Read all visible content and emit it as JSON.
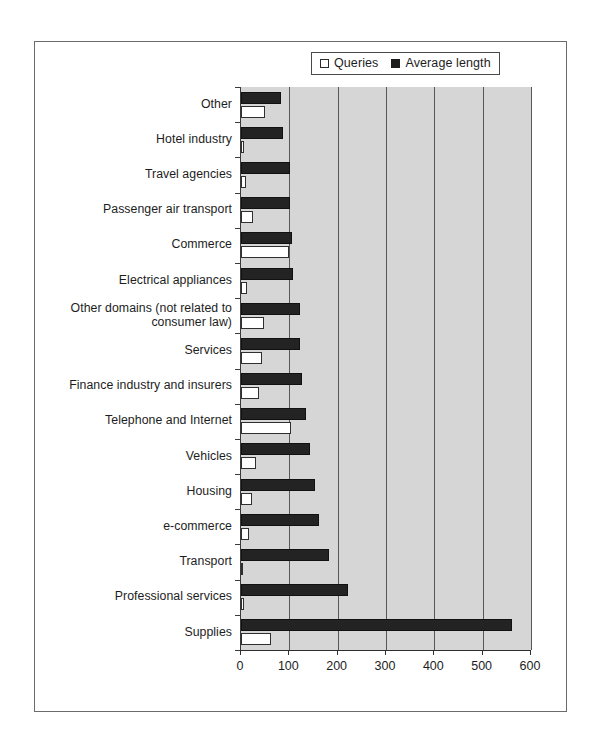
{
  "legend": {
    "entries": [
      {
        "label": "Queries",
        "icon": "hollow-square",
        "color": "#ffffff"
      },
      {
        "label": "Average length",
        "icon": "filled-square",
        "color": "#232323"
      }
    ]
  },
  "axis": {
    "x_ticks": [
      "0",
      "100",
      "200",
      "300",
      "400",
      "500",
      "600"
    ]
  },
  "chart_data": {
    "type": "bar",
    "orientation": "horizontal",
    "title": "",
    "xlabel": "",
    "ylabel": "",
    "xlim": [
      0,
      600
    ],
    "xticks": [
      0,
      100,
      200,
      300,
      400,
      500,
      600
    ],
    "grid": true,
    "legend_position": "top-right",
    "plot_background": "#d6d6d6",
    "categories": [
      "Other",
      "Hotel industry",
      "Travel agencies",
      "Passenger air transport",
      "Commerce",
      "Electrical appliances",
      "Other domains (not related to\nconsumer law)",
      "Services",
      "Finance industry and insurers",
      "Telephone and Internet",
      "Vehicles",
      "Housing",
      "e-commerce",
      "Transport",
      "Professional services",
      "Supplies"
    ],
    "series": [
      {
        "name": "Average length",
        "color": "#232323",
        "values": [
          83,
          87,
          102,
          102,
          105,
          108,
          122,
          122,
          127,
          135,
          142,
          154,
          162,
          182,
          222,
          560
        ]
      },
      {
        "name": "Queries",
        "color": "#ffffff",
        "values": [
          50,
          7,
          10,
          25,
          100,
          13,
          48,
          44,
          38,
          104,
          31,
          23,
          17,
          2,
          6,
          62
        ]
      }
    ]
  }
}
